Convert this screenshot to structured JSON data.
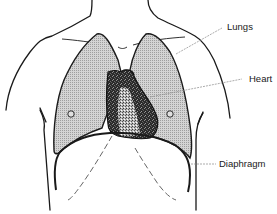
{
  "diagram": {
    "type": "anatomical-illustration",
    "labels": {
      "lungs": "Lungs",
      "heart": "Heart",
      "diaphragm": "Diaphragm"
    },
    "colors": {
      "outline": "#1a1a1a",
      "lung_fill": "#c8c8c8",
      "heart_fill": "#2a2a2a",
      "heart_inner": "#9a9a9a",
      "leader_line": "#888888",
      "background": "#ffffff"
    }
  }
}
